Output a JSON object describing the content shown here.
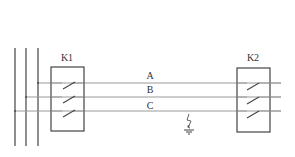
{
  "diagram": {
    "type": "three-phase circuit schematic",
    "bus": {
      "lines": 3
    },
    "switches": [
      {
        "id": "k1",
        "label": "K1"
      },
      {
        "id": "k2",
        "label": "K2"
      }
    ],
    "phases": [
      {
        "id": "a",
        "label": "A"
      },
      {
        "id": "b",
        "label": "B"
      },
      {
        "id": "c",
        "label": "C"
      }
    ],
    "fault": {
      "type": "ground-fault",
      "phase": "C",
      "icon": "ground-icon"
    },
    "colors": {
      "line": "#444444",
      "wire": "#9a9a9a",
      "text": "#333333"
    }
  }
}
